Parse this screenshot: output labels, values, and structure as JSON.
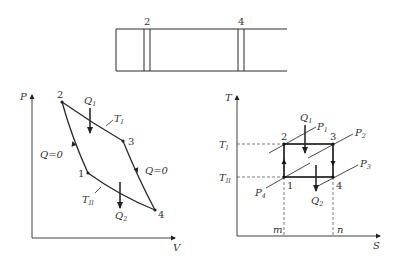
{
  "cylinder": {
    "piston_labels": [
      "2",
      "4"
    ]
  },
  "pv_diagram": {
    "y_axis_label": "P",
    "x_axis_label": "V",
    "points": [
      {
        "id": "1",
        "label": "1"
      },
      {
        "id": "2",
        "label": "2"
      },
      {
        "id": "3",
        "label": "3"
      },
      {
        "id": "4",
        "label": "4"
      }
    ],
    "heat_in": {
      "symbol": "Q",
      "sub": "1"
    },
    "heat_out": {
      "symbol": "Q",
      "sub": "2"
    },
    "isotherm_hot": {
      "symbol": "T",
      "sub": "I"
    },
    "isotherm_cold": {
      "symbol": "T",
      "sub": "II"
    },
    "adiabatic_left": "Q=0",
    "adiabatic_right": "Q=0"
  },
  "ts_diagram": {
    "y_axis_label": "T",
    "x_axis_label": "S",
    "points": [
      {
        "id": "1",
        "label": "1"
      },
      {
        "id": "2",
        "label": "2"
      },
      {
        "id": "3",
        "label": "3"
      },
      {
        "id": "4",
        "label": "4"
      }
    ],
    "t_hot": {
      "symbol": "T",
      "sub": "I"
    },
    "t_cold": {
      "symbol": "T",
      "sub": "II"
    },
    "heat_in": {
      "symbol": "Q",
      "sub": "1"
    },
    "heat_out": {
      "symbol": "Q",
      "sub": "2"
    },
    "isobars": [
      {
        "symbol": "P",
        "sub": "1"
      },
      {
        "symbol": "P",
        "sub": "2"
      },
      {
        "symbol": "P",
        "sub": "3"
      },
      {
        "symbol": "P",
        "sub": "4"
      }
    ],
    "s_marks": [
      "m",
      "n"
    ]
  }
}
